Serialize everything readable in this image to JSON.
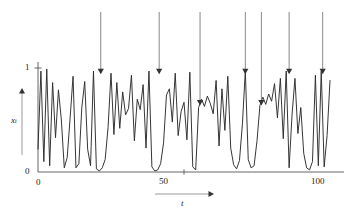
{
  "figure": {
    "name": "chaotic-time-series-intermittency",
    "background": "#ffffff",
    "line_color": "#2b2b2b",
    "axis_color": "#555555",
    "arrow_color": "#333333"
  },
  "axes": {
    "y": {
      "label": "x",
      "label_sub": "t",
      "ticks": [
        "1",
        "0"
      ],
      "tick_values": [
        1,
        0
      ],
      "range": [
        0,
        1
      ],
      "arrow_direction": "up"
    },
    "x": {
      "label": "t",
      "ticks": [
        "0",
        "50",
        "100"
      ],
      "tick_values": [
        0,
        50,
        100
      ],
      "range": [
        0,
        100
      ],
      "arrow_direction": "right"
    }
  },
  "annotations": {
    "arrow_label": "laminar-phase-marker",
    "arrows": [
      {
        "t": 21.5,
        "tip_y": 0.94,
        "length": "long"
      },
      {
        "t": 41.5,
        "tip_y": 0.94,
        "length": "long"
      },
      {
        "t": 55.5,
        "tip_y": 0.64,
        "length": "extra-long"
      },
      {
        "t": 71.0,
        "tip_y": 0.94,
        "length": "long"
      },
      {
        "t": 76.5,
        "tip_y": 0.64,
        "length": "extra-long"
      },
      {
        "t": 86.0,
        "tip_y": 0.94,
        "length": "long"
      },
      {
        "t": 97.5,
        "tip_y": 0.94,
        "length": "long"
      }
    ]
  },
  "chart_data": {
    "type": "line",
    "title": "",
    "xlabel": "t",
    "ylabel": "x_t",
    "xlim": [
      0,
      100
    ],
    "ylim": [
      0,
      1.02
    ],
    "grid": false,
    "legend": "none",
    "series": [
      {
        "name": "x_t",
        "x": [
          0,
          1,
          2,
          3,
          4,
          5,
          6,
          7,
          8,
          9,
          10,
          11,
          12,
          13,
          14,
          15,
          16,
          17,
          18,
          19,
          20,
          21,
          22,
          23,
          24,
          25,
          26,
          27,
          28,
          29,
          30,
          31,
          32,
          33,
          34,
          35,
          36,
          37,
          38,
          39,
          40,
          41,
          42,
          43,
          44,
          45,
          46,
          47,
          48,
          49,
          50,
          51,
          52,
          53,
          54,
          55,
          56,
          57,
          58,
          59,
          60,
          61,
          62,
          63,
          64,
          65,
          66,
          67,
          68,
          69,
          70,
          71,
          72,
          73,
          74,
          75,
          76,
          77,
          78,
          79,
          80,
          81,
          82,
          83,
          84,
          85,
          86,
          87,
          88,
          89,
          90,
          91,
          92,
          93,
          94,
          95,
          96,
          97,
          98,
          99,
          100
        ],
        "values": [
          0.22,
          0.97,
          0.1,
          0.99,
          0.06,
          0.86,
          0.33,
          0.79,
          0.5,
          0.04,
          0.14,
          0.52,
          0.92,
          0.04,
          0.08,
          0.62,
          0.87,
          0.22,
          0.06,
          0.97,
          0.03,
          0.01,
          0.04,
          0.12,
          0.43,
          0.95,
          0.36,
          0.86,
          0.42,
          0.77,
          0.55,
          0.61,
          0.93,
          0.3,
          0.7,
          0.6,
          0.84,
          0.23,
          0.97,
          0.05,
          0.01,
          0.02,
          0.08,
          0.28,
          0.74,
          0.8,
          0.48,
          0.95,
          0.35,
          0.58,
          0.67,
          0.31,
          0.96,
          0.05,
          0.02,
          0.62,
          0.7,
          0.63,
          0.73,
          0.66,
          0.56,
          0.88,
          0.25,
          0.8,
          0.4,
          0.92,
          0.23,
          0.07,
          0.03,
          0.11,
          0.46,
          0.97,
          0.12,
          0.04,
          0.06,
          0.3,
          0.64,
          0.72,
          0.65,
          0.75,
          0.68,
          0.85,
          0.52,
          0.9,
          0.32,
          0.97,
          0.04,
          0.55,
          0.9,
          0.37,
          0.62,
          0.18,
          0.04,
          0.02,
          0.1,
          0.93,
          0.06,
          0.97,
          0.05,
          0.35,
          0.88
        ]
      }
    ]
  }
}
